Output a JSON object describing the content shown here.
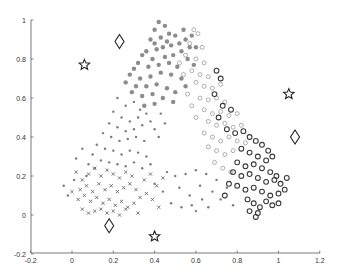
{
  "chart_data": {
    "type": "scatter",
    "title": "",
    "xlabel": "",
    "ylabel": "",
    "xlim": [
      -0.2,
      1.2
    ],
    "ylim": [
      -0.2,
      1.0
    ],
    "grid": false,
    "legend": null,
    "xticks": [
      "-0.2",
      "0",
      "0.2",
      "0.4",
      "0.6",
      "0.8",
      "1",
      "1.2"
    ],
    "yticks": [
      "-0.2",
      "0",
      "0.2",
      "0.4",
      "0.6",
      "0.8",
      "1"
    ],
    "series": [
      {
        "name": "cluster-top-filled",
        "marker": "filled-dot-large",
        "color": "#8c8c8c",
        "points": [
          [
            0.42,
            0.99
          ],
          [
            0.45,
            0.97
          ],
          [
            0.4,
            0.95
          ],
          [
            0.47,
            0.93
          ],
          [
            0.43,
            0.91
          ],
          [
            0.38,
            0.9
          ],
          [
            0.5,
            0.92
          ],
          [
            0.52,
            0.88
          ],
          [
            0.48,
            0.87
          ],
          [
            0.44,
            0.86
          ],
          [
            0.41,
            0.85
          ],
          [
            0.36,
            0.84
          ],
          [
            0.55,
            0.9
          ],
          [
            0.57,
            0.86
          ],
          [
            0.53,
            0.84
          ],
          [
            0.49,
            0.82
          ],
          [
            0.45,
            0.81
          ],
          [
            0.39,
            0.8
          ],
          [
            0.34,
            0.82
          ],
          [
            0.32,
            0.78
          ],
          [
            0.37,
            0.76
          ],
          [
            0.42,
            0.77
          ],
          [
            0.47,
            0.78
          ],
          [
            0.51,
            0.76
          ],
          [
            0.56,
            0.8
          ],
          [
            0.59,
            0.77
          ],
          [
            0.3,
            0.75
          ],
          [
            0.28,
            0.72
          ],
          [
            0.33,
            0.7
          ],
          [
            0.38,
            0.71
          ],
          [
            0.43,
            0.73
          ],
          [
            0.48,
            0.72
          ],
          [
            0.53,
            0.7
          ],
          [
            0.26,
            0.68
          ],
          [
            0.31,
            0.66
          ],
          [
            0.36,
            0.66
          ],
          [
            0.41,
            0.67
          ],
          [
            0.46,
            0.65
          ],
          [
            0.5,
            0.63
          ],
          [
            0.55,
            0.66
          ],
          [
            0.29,
            0.63
          ],
          [
            0.34,
            0.61
          ],
          [
            0.39,
            0.62
          ],
          [
            0.44,
            0.6
          ],
          [
            0.49,
            0.58
          ],
          [
            0.4,
            0.57
          ],
          [
            0.35,
            0.56
          ],
          [
            0.58,
            0.92
          ],
          [
            0.6,
            0.86
          ],
          [
            0.46,
            0.89
          ],
          [
            0.54,
            0.95
          ],
          [
            0.4,
            0.88
          ]
        ]
      },
      {
        "name": "cluster-left-small",
        "marker": "small-dot",
        "color": "#7a7a7a",
        "points": [
          [
            0.22,
            0.6
          ],
          [
            0.26,
            0.56
          ],
          [
            0.3,
            0.58
          ],
          [
            0.33,
            0.54
          ],
          [
            0.2,
            0.53
          ],
          [
            0.24,
            0.5
          ],
          [
            0.28,
            0.48
          ],
          [
            0.32,
            0.5
          ],
          [
            0.36,
            0.52
          ],
          [
            0.18,
            0.47
          ],
          [
            0.22,
            0.45
          ],
          [
            0.26,
            0.43
          ],
          [
            0.3,
            0.44
          ],
          [
            0.34,
            0.46
          ],
          [
            0.38,
            0.48
          ],
          [
            0.15,
            0.42
          ],
          [
            0.19,
            0.4
          ],
          [
            0.23,
            0.38
          ],
          [
            0.27,
            0.39
          ],
          [
            0.31,
            0.4
          ],
          [
            0.35,
            0.38
          ],
          [
            0.4,
            0.44
          ],
          [
            0.12,
            0.36
          ],
          [
            0.16,
            0.34
          ],
          [
            0.2,
            0.33
          ],
          [
            0.24,
            0.31
          ],
          [
            0.28,
            0.33
          ],
          [
            0.32,
            0.32
          ],
          [
            0.36,
            0.3
          ],
          [
            0.1,
            0.31
          ],
          [
            0.14,
            0.28
          ],
          [
            0.18,
            0.27
          ],
          [
            0.22,
            0.26
          ],
          [
            0.26,
            0.25
          ],
          [
            0.3,
            0.27
          ],
          [
            0.34,
            0.24
          ],
          [
            0.38,
            0.26
          ],
          [
            0.08,
            0.26
          ],
          [
            0.11,
            0.24
          ],
          [
            0.05,
            0.34
          ],
          [
            0.02,
            0.29
          ],
          [
            0.43,
            0.52
          ],
          [
            0.45,
            0.47
          ],
          [
            0.42,
            0.4
          ],
          [
            0.07,
            0.2
          ],
          [
            -0.04,
            0.15
          ],
          [
            -0.02,
            0.1
          ],
          [
            0.01,
            0.18
          ],
          [
            0.46,
            0.22
          ],
          [
            0.5,
            0.2
          ],
          [
            0.55,
            0.21
          ],
          [
            0.6,
            0.23
          ],
          [
            0.65,
            0.21
          ],
          [
            0.52,
            0.14
          ],
          [
            0.57,
            0.1
          ],
          [
            0.62,
            0.15
          ],
          [
            0.68,
            0.12
          ],
          [
            0.48,
            0.06
          ],
          [
            0.53,
            0.04
          ],
          [
            0.58,
            0.05
          ],
          [
            0.63,
            0.08
          ],
          [
            0.7,
            0.18
          ],
          [
            0.72,
            0.08
          ],
          [
            0.75,
            0.14
          ],
          [
            0.78,
            0.05
          ],
          [
            0.44,
            0.12
          ],
          [
            0.4,
            0.16
          ],
          [
            0.6,
            0.02
          ],
          [
            0.66,
            0.04
          ]
        ]
      },
      {
        "name": "cluster-bottom-x",
        "marker": "x",
        "color": "#6a6a6a",
        "points": [
          [
            0.02,
            0.22
          ],
          [
            0.05,
            0.18
          ],
          [
            0.08,
            0.21
          ],
          [
            0.11,
            0.24
          ],
          [
            0.14,
            0.2
          ],
          [
            0.17,
            0.23
          ],
          [
            0.2,
            0.21
          ],
          [
            0.23,
            0.19
          ],
          [
            0.26,
            0.22
          ],
          [
            0.04,
            0.13
          ],
          [
            0.07,
            0.15
          ],
          [
            0.1,
            0.12
          ],
          [
            0.13,
            0.16
          ],
          [
            0.16,
            0.13
          ],
          [
            0.19,
            0.15
          ],
          [
            0.22,
            0.12
          ],
          [
            0.25,
            0.14
          ],
          [
            0.28,
            0.16
          ],
          [
            0.31,
            0.13
          ],
          [
            0.03,
            0.08
          ],
          [
            0.06,
            0.1
          ],
          [
            0.09,
            0.07
          ],
          [
            0.12,
            0.09
          ],
          [
            0.15,
            0.06
          ],
          [
            0.18,
            0.08
          ],
          [
            0.21,
            0.05
          ],
          [
            0.24,
            0.07
          ],
          [
            0.27,
            0.04
          ],
          [
            0.3,
            0.06
          ],
          [
            0.33,
            0.09
          ],
          [
            0.36,
            0.11
          ],
          [
            0.39,
            0.08
          ],
          [
            0.05,
            0.03
          ],
          [
            0.08,
            0.01
          ],
          [
            0.11,
            0.02
          ],
          [
            0.14,
            0.03
          ],
          [
            0.17,
            0.01
          ],
          [
            0.2,
            0.02
          ],
          [
            0.23,
            0.0
          ],
          [
            0.26,
            0.03
          ],
          [
            0.35,
            0.18
          ],
          [
            0.38,
            0.21
          ],
          [
            0.41,
            0.15
          ],
          [
            0.44,
            0.19
          ],
          [
            0.32,
            0.01
          ],
          [
            0.42,
            0.04
          ],
          [
            0.0,
            0.12
          ],
          [
            0.29,
            0.2
          ]
        ]
      },
      {
        "name": "cluster-right-light-circles",
        "marker": "open-circle-light",
        "color": "#9a9a9a",
        "points": [
          [
            0.59,
            0.95
          ],
          [
            0.61,
            0.93
          ],
          [
            0.57,
            0.88
          ],
          [
            0.63,
            0.86
          ],
          [
            0.55,
            0.82
          ],
          [
            0.6,
            0.8
          ],
          [
            0.64,
            0.78
          ],
          [
            0.52,
            0.78
          ],
          [
            0.58,
            0.74
          ],
          [
            0.62,
            0.72
          ],
          [
            0.66,
            0.71
          ],
          [
            0.54,
            0.72
          ],
          [
            0.6,
            0.68
          ],
          [
            0.64,
            0.66
          ],
          [
            0.68,
            0.65
          ],
          [
            0.72,
            0.67
          ],
          [
            0.56,
            0.62
          ],
          [
            0.62,
            0.6
          ],
          [
            0.66,
            0.59
          ],
          [
            0.7,
            0.6
          ],
          [
            0.74,
            0.58
          ],
          [
            0.58,
            0.56
          ],
          [
            0.64,
            0.54
          ],
          [
            0.68,
            0.52
          ],
          [
            0.72,
            0.53
          ],
          [
            0.76,
            0.51
          ],
          [
            0.8,
            0.52
          ],
          [
            0.6,
            0.5
          ],
          [
            0.66,
            0.48
          ],
          [
            0.7,
            0.46
          ],
          [
            0.74,
            0.47
          ],
          [
            0.78,
            0.45
          ],
          [
            0.82,
            0.46
          ],
          [
            0.64,
            0.42
          ],
          [
            0.68,
            0.4
          ],
          [
            0.72,
            0.38
          ],
          [
            0.76,
            0.4
          ],
          [
            0.8,
            0.38
          ],
          [
            0.84,
            0.37
          ],
          [
            0.66,
            0.35
          ],
          [
            0.7,
            0.33
          ],
          [
            0.74,
            0.31
          ],
          [
            0.78,
            0.33
          ],
          [
            0.69,
            0.27
          ],
          [
            0.73,
            0.24
          ],
          [
            0.77,
            0.22
          ]
        ]
      },
      {
        "name": "cluster-right-dark-circles",
        "marker": "open-circle-dark",
        "color": "#3a3a3a",
        "points": [
          [
            0.7,
            0.74
          ],
          [
            0.72,
            0.7
          ],
          [
            0.69,
            0.62
          ],
          [
            0.73,
            0.56
          ],
          [
            0.77,
            0.54
          ],
          [
            0.71,
            0.5
          ],
          [
            0.75,
            0.44
          ],
          [
            0.79,
            0.42
          ],
          [
            0.83,
            0.43
          ],
          [
            0.86,
            0.4
          ],
          [
            0.89,
            0.38
          ],
          [
            0.92,
            0.36
          ],
          [
            0.95,
            0.33
          ],
          [
            0.82,
            0.34
          ],
          [
            0.86,
            0.32
          ],
          [
            0.9,
            0.3
          ],
          [
            0.94,
            0.28
          ],
          [
            0.97,
            0.3
          ],
          [
            0.8,
            0.27
          ],
          [
            0.84,
            0.25
          ],
          [
            0.88,
            0.26
          ],
          [
            0.92,
            0.24
          ],
          [
            0.96,
            0.22
          ],
          [
            0.99,
            0.2
          ],
          [
            0.78,
            0.22
          ],
          [
            0.82,
            0.2
          ],
          [
            0.86,
            0.21
          ],
          [
            0.9,
            0.19
          ],
          [
            0.94,
            0.17
          ],
          [
            0.98,
            0.18
          ],
          [
            1.01,
            0.16
          ],
          [
            1.04,
            0.19
          ],
          [
            0.8,
            0.15
          ],
          [
            0.84,
            0.13
          ],
          [
            0.88,
            0.14
          ],
          [
            0.92,
            0.12
          ],
          [
            0.96,
            0.1
          ],
          [
            1.0,
            0.11
          ],
          [
            1.03,
            0.13
          ],
          [
            0.85,
            0.08
          ],
          [
            0.88,
            0.06
          ],
          [
            0.91,
            0.04
          ],
          [
            0.94,
            0.07
          ],
          [
            0.97,
            0.05
          ],
          [
            1.0,
            0.06
          ],
          [
            0.86,
            0.02
          ],
          [
            0.9,
            0.01
          ],
          [
            0.89,
            -0.01
          ],
          [
            0.76,
            0.16
          ],
          [
            0.74,
            0.1
          ]
        ]
      },
      {
        "name": "stars",
        "marker": "star",
        "color": "#222222",
        "points": [
          [
            0.06,
            0.77
          ],
          [
            1.05,
            0.62
          ],
          [
            0.4,
            -0.11
          ]
        ]
      },
      {
        "name": "diamonds",
        "marker": "diamond",
        "color": "#222222",
        "points": [
          [
            0.23,
            0.89
          ],
          [
            1.08,
            0.4
          ],
          [
            0.18,
            -0.055
          ]
        ]
      }
    ]
  }
}
